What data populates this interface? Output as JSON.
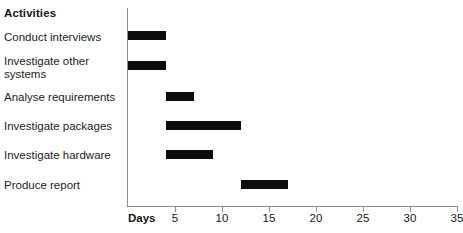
{
  "header": {
    "activities_label": "Activities"
  },
  "axis": {
    "title": "Days",
    "ticks": [
      5,
      10,
      15,
      20,
      25,
      30,
      35
    ],
    "min": 0,
    "max": 35,
    "bar_color": "#0d0d0d",
    "axis_color": "#8d8d8d"
  },
  "rows": [
    {
      "label": "Conduct interviews",
      "start": 0,
      "end": 4
    },
    {
      "label": "Investigate other\nsystems",
      "start": 0,
      "end": 4
    },
    {
      "label": "Analyse requirements",
      "start": 4,
      "end": 7
    },
    {
      "label": "Investigate packages",
      "start": 4,
      "end": 12
    },
    {
      "label": "Investigate hardware",
      "start": 4,
      "end": 9
    },
    {
      "label": "Produce report",
      "start": 12,
      "end": 17
    }
  ],
  "chart_data": {
    "type": "bar",
    "title": "Activities",
    "xlabel": "Days",
    "ylabel": "Activities",
    "xlim": [
      0,
      35
    ],
    "grid": false,
    "legend": "none",
    "orientation": "horizontal",
    "subtype": "gantt",
    "categories": [
      "Conduct interviews",
      "Investigate other systems",
      "Analyse requirements",
      "Investigate packages",
      "Investigate hardware",
      "Produce report"
    ],
    "starts": [
      0,
      0,
      4,
      4,
      4,
      12
    ],
    "ends": [
      4,
      4,
      7,
      12,
      9,
      17
    ],
    "durations": [
      4,
      4,
      3,
      8,
      5,
      5
    ],
    "xticks": [
      5,
      10,
      15,
      20,
      25,
      30,
      35
    ],
    "series": [
      {
        "name": "Task duration (days)",
        "values": [
          4,
          4,
          3,
          8,
          5,
          5
        ]
      }
    ]
  }
}
